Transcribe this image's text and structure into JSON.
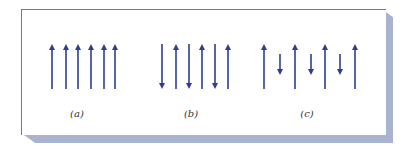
{
  "figure": {
    "frame_color": "#6c7aa0",
    "shadow_color": "#a9b3cf",
    "arrow_color": "#2e3f8f",
    "panels": [
      {
        "label": "(a)",
        "label_x": 77,
        "description": "Six parallel arrows all pointing up",
        "arrows": [
          {
            "x": 52,
            "dir": "up",
            "y1": 44,
            "y2": 89
          },
          {
            "x": 66,
            "dir": "up",
            "y1": 44,
            "y2": 89
          },
          {
            "x": 78,
            "dir": "up",
            "y1": 44,
            "y2": 89
          },
          {
            "x": 91,
            "dir": "up",
            "y1": 44,
            "y2": 89
          },
          {
            "x": 104,
            "dir": "up",
            "y1": 44,
            "y2": 89
          },
          {
            "x": 115,
            "dir": "up",
            "y1": 44,
            "y2": 89
          }
        ]
      },
      {
        "label": "(b)",
        "label_x": 191,
        "description": "Six parallel arrows alternating down and up, equal length",
        "arrows": [
          {
            "x": 162,
            "dir": "down",
            "y1": 44,
            "y2": 89
          },
          {
            "x": 176,
            "dir": "up",
            "y1": 44,
            "y2": 89
          },
          {
            "x": 189,
            "dir": "down",
            "y1": 44,
            "y2": 89
          },
          {
            "x": 202,
            "dir": "up",
            "y1": 44,
            "y2": 89
          },
          {
            "x": 215,
            "dir": "down",
            "y1": 44,
            "y2": 89
          },
          {
            "x": 228,
            "dir": "up",
            "y1": 44,
            "y2": 89
          }
        ]
      },
      {
        "label": "(c)",
        "label_x": 307,
        "description": "Alternating long up arrows and short down arrows",
        "arrows": [
          {
            "x": 264,
            "dir": "up",
            "y1": 44,
            "y2": 89
          },
          {
            "x": 280,
            "dir": "down",
            "y1": 54,
            "y2": 75
          },
          {
            "x": 295,
            "dir": "up",
            "y1": 44,
            "y2": 89
          },
          {
            "x": 311,
            "dir": "down",
            "y1": 54,
            "y2": 75
          },
          {
            "x": 325,
            "dir": "up",
            "y1": 44,
            "y2": 89
          },
          {
            "x": 340,
            "dir": "down",
            "y1": 54,
            "y2": 75
          },
          {
            "x": 355,
            "dir": "up",
            "y1": 44,
            "y2": 89
          }
        ]
      }
    ]
  }
}
